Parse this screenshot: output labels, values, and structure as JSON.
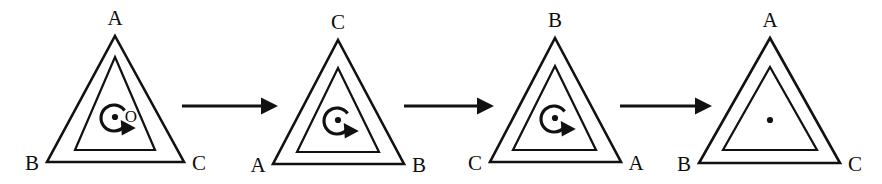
{
  "figure": {
    "type": "rotation-sequence-diagram",
    "canvas": {
      "width": 882,
      "height": 184,
      "background": "#ffffff"
    },
    "stroke_color": "#111111",
    "panel_count": 4,
    "arrow_count": 3,
    "description_labels": {
      "center_point": "O"
    },
    "panels": [
      {
        "id": "panel-1",
        "index": 1,
        "apex_label": "A",
        "bottom_left_label": "B",
        "bottom_right_label": "C",
        "center_label": "O",
        "has_center_label": true,
        "has_rotation_arrow": true,
        "apex": {
          "x": 115,
          "y": 36
        },
        "bottom_left": {
          "x": 47,
          "y": 162
        },
        "bottom_right": {
          "x": 184,
          "y": 162
        },
        "inner_apex": {
          "x": 115,
          "y": 57
        },
        "inner_bottom_left": {
          "x": 75,
          "y": 150
        },
        "inner_bottom_right": {
          "x": 155,
          "y": 150
        },
        "center": {
          "x": 115,
          "y": 117
        }
      },
      {
        "id": "panel-2",
        "index": 2,
        "apex_label": "C",
        "bottom_left_label": "A",
        "bottom_right_label": "B",
        "center_label": "",
        "has_center_label": false,
        "has_rotation_arrow": true,
        "apex": {
          "x": 338,
          "y": 40
        },
        "bottom_left": {
          "x": 273,
          "y": 164
        },
        "bottom_right": {
          "x": 404,
          "y": 164
        },
        "inner_apex": {
          "x": 338,
          "y": 68
        },
        "inner_bottom_left": {
          "x": 297,
          "y": 152
        },
        "inner_bottom_right": {
          "x": 379,
          "y": 152
        },
        "center": {
          "x": 338,
          "y": 120
        }
      },
      {
        "id": "panel-3",
        "index": 3,
        "apex_label": "B",
        "bottom_left_label": "C",
        "bottom_right_label": "A",
        "center_label": "",
        "has_center_label": false,
        "has_rotation_arrow": true,
        "apex": {
          "x": 555,
          "y": 38
        },
        "bottom_left": {
          "x": 490,
          "y": 162
        },
        "bottom_right": {
          "x": 621,
          "y": 162
        },
        "inner_apex": {
          "x": 555,
          "y": 66
        },
        "inner_bottom_left": {
          "x": 513,
          "y": 150
        },
        "inner_bottom_right": {
          "x": 596,
          "y": 150
        },
        "center": {
          "x": 555,
          "y": 118
        }
      },
      {
        "id": "panel-4",
        "index": 4,
        "apex_label": "A",
        "bottom_left_label": "B",
        "bottom_right_label": "C",
        "center_label": "",
        "has_center_label": false,
        "has_rotation_arrow": false,
        "apex": {
          "x": 770,
          "y": 38
        },
        "bottom_left": {
          "x": 699,
          "y": 163
        },
        "bottom_right": {
          "x": 840,
          "y": 163
        },
        "inner_apex": {
          "x": 770,
          "y": 67
        },
        "inner_bottom_left": {
          "x": 723,
          "y": 150
        },
        "inner_bottom_right": {
          "x": 817,
          "y": 150
        },
        "center": {
          "x": 770,
          "y": 120
        }
      }
    ],
    "arrows": [
      {
        "id": "arrow-1",
        "from_panel": 1,
        "to_panel": 2,
        "x1": 182,
        "x2": 278,
        "y": 106
      },
      {
        "id": "arrow-2",
        "from_panel": 2,
        "to_panel": 3,
        "x1": 404,
        "x2": 494,
        "y": 106
      },
      {
        "id": "arrow-3",
        "from_panel": 3,
        "to_panel": 4,
        "x1": 620,
        "x2": 712,
        "y": 106
      }
    ]
  }
}
